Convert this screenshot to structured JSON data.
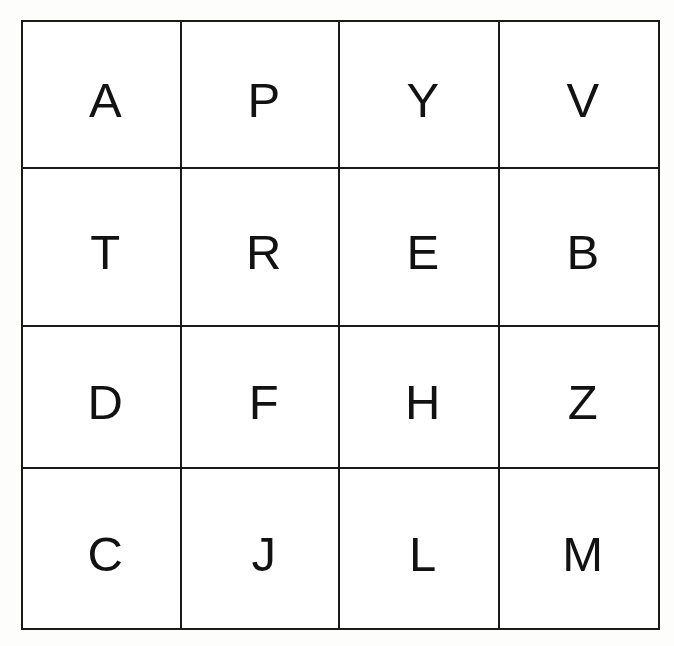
{
  "page": {
    "background_color": "#fdfdfc"
  },
  "grid": {
    "rows": 4,
    "columns": 4,
    "border_color": "#1a1a1a",
    "cell_background": "#ffffff",
    "letter_color": "#121212",
    "cells": [
      [
        {
          "letter": "A",
          "row": 0,
          "col": 0
        },
        {
          "letter": "P",
          "row": 0,
          "col": 1
        },
        {
          "letter": "Y",
          "row": 0,
          "col": 2
        },
        {
          "letter": "V",
          "row": 0,
          "col": 3
        }
      ],
      [
        {
          "letter": "T",
          "row": 1,
          "col": 0
        },
        {
          "letter": "R",
          "row": 1,
          "col": 1
        },
        {
          "letter": "E",
          "row": 1,
          "col": 2
        },
        {
          "letter": "B",
          "row": 1,
          "col": 3
        }
      ],
      [
        {
          "letter": "D",
          "row": 2,
          "col": 0
        },
        {
          "letter": "F",
          "row": 2,
          "col": 1
        },
        {
          "letter": "H",
          "row": 2,
          "col": 2
        },
        {
          "letter": "Z",
          "row": 2,
          "col": 3
        }
      ],
      [
        {
          "letter": "C",
          "row": 3,
          "col": 0
        },
        {
          "letter": "J",
          "row": 3,
          "col": 1
        },
        {
          "letter": "L",
          "row": 3,
          "col": 2
        },
        {
          "letter": "M",
          "row": 3,
          "col": 3
        }
      ]
    ]
  }
}
